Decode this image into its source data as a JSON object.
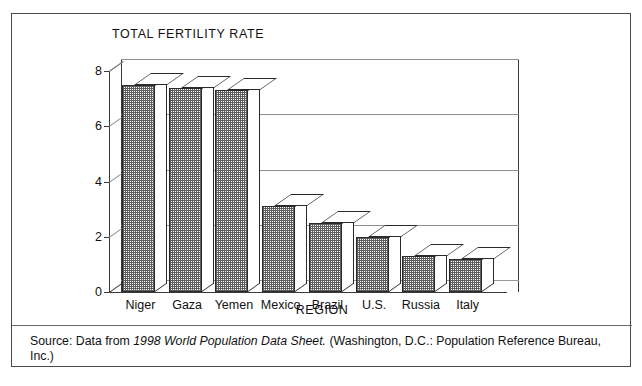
{
  "chart_data": {
    "type": "bar",
    "title": "TOTAL FERTILITY RATE",
    "xlabel": "REGION",
    "ylabel": "",
    "categories": [
      "Niger",
      "Gaza",
      "Yemen",
      "Mexico",
      "Brazil",
      "U.S.",
      "Russia",
      "Italy"
    ],
    "values": [
      7.5,
      7.4,
      7.3,
      3.1,
      2.5,
      2.0,
      1.3,
      1.2
    ],
    "ylim": [
      0,
      8
    ],
    "yticks": [
      0,
      2,
      4,
      6,
      8
    ],
    "ytick_labels": [
      "0",
      "2",
      "4",
      "6",
      "8"
    ],
    "grid": true,
    "grid_axis": "y",
    "legend": false,
    "style": "3d-bar-hatched"
  },
  "figure": {
    "source_prefix": "Source: Data from ",
    "source_italic": "1998 World Population Data Sheet.",
    "source_suffix": " (Washington, D.C.: Population Reference Bureau, Inc.)"
  }
}
